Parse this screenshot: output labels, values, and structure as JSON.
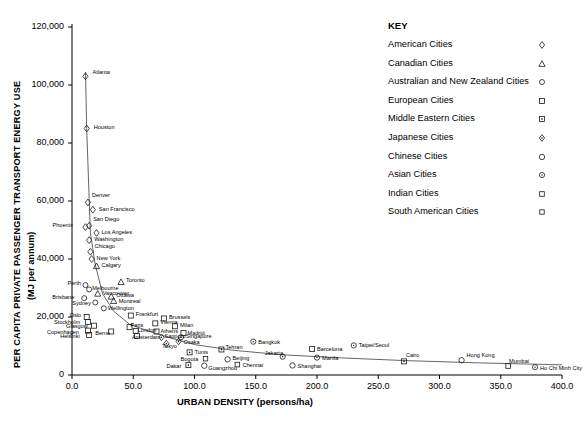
{
  "chart_data": {
    "type": "scatter",
    "title": "",
    "xlabel": "URBAN DENSITY (persons/ha)",
    "ylabel": "PER CAPITA PRIVATE PASSENGER TRANSPORT ENERGY USE",
    "ylabel_sub": "(MJ per annum)",
    "xlim": [
      0,
      400
    ],
    "ylim": [
      0,
      120000
    ],
    "xticks": [
      "0.0",
      "50.0",
      "100.0",
      "150.0",
      "200.0",
      "250.0",
      "300.0",
      "350.0",
      "400.0"
    ],
    "xtick_values": [
      0,
      50,
      100,
      150,
      200,
      250,
      300,
      350,
      400
    ],
    "yticks": [
      "0",
      "20,000",
      "40,000",
      "60,000",
      "80,000",
      "100,000",
      "120,000"
    ],
    "ytick_values": [
      0,
      20000,
      40000,
      60000,
      80000,
      100000,
      120000
    ],
    "grid": false,
    "legend_position": "right-top",
    "trend_line": true,
    "points": [
      {
        "label": "Atlanta",
        "x": 11,
        "y": 103000,
        "group": "american",
        "lx": 7,
        "ly": -7
      },
      {
        "label": "Houston",
        "x": 12,
        "y": 85000,
        "group": "american",
        "lx": 7,
        "ly": -5
      },
      {
        "label": "Denver",
        "x": 13,
        "y": 59500,
        "group": "american",
        "lx": 4,
        "ly": -10
      },
      {
        "label": "San Francisco",
        "x": 17,
        "y": 57000,
        "group": "american",
        "lx": 6,
        "ly": -4
      },
      {
        "label": "Phoenix",
        "x": 11,
        "y": 51000,
        "group": "american",
        "lx": -33,
        "ly": -5
      },
      {
        "label": "San Diego",
        "x": 14,
        "y": 51500,
        "group": "american",
        "lx": 4,
        "ly": -10
      },
      {
        "label": "Los Angeles",
        "x": 20,
        "y": 49000,
        "group": "american",
        "lx": 5,
        "ly": -4
      },
      {
        "label": "Washington",
        "x": 14,
        "y": 46500,
        "group": "american",
        "lx": 5,
        "ly": -4
      },
      {
        "label": "Chicago",
        "x": 15,
        "y": 42500,
        "group": "american",
        "lx": 4,
        "ly": -9
      },
      {
        "label": "New York",
        "x": 16,
        "y": 40000,
        "group": "american",
        "lx": 5,
        "ly": -4
      },
      {
        "label": "Calgary",
        "x": 20,
        "y": 37500,
        "group": "canadian",
        "lx": 5,
        "ly": -4
      },
      {
        "label": "Perth",
        "x": 11,
        "y": 31000,
        "group": "anzac",
        "lx": -18,
        "ly": -5
      },
      {
        "label": "Toronto",
        "x": 40,
        "y": 32000,
        "group": "canadian",
        "lx": 5,
        "ly": -5
      },
      {
        "label": "Melbourne",
        "x": 14,
        "y": 29500,
        "group": "anzac",
        "lx": 3,
        "ly": -4
      },
      {
        "label": "Vancouver",
        "x": 21,
        "y": 28000,
        "group": "canadian",
        "lx": 5,
        "ly": -4
      },
      {
        "label": "Brisbane",
        "x": 10,
        "y": 26500,
        "group": "anzac",
        "lx": -32,
        "ly": -4
      },
      {
        "label": "Ottawa",
        "x": 32,
        "y": 27000,
        "group": "canadian",
        "lx": 5,
        "ly": -5
      },
      {
        "label": "Sydney",
        "x": 19,
        "y": 25000,
        "group": "anzac",
        "lx": -23,
        "ly": -3
      },
      {
        "label": "Montreal",
        "x": 34,
        "y": 25500,
        "group": "canadian",
        "lx": 5,
        "ly": -3
      },
      {
        "label": "Wellington",
        "x": 26,
        "y": 23000,
        "group": "anzac",
        "lx": 4,
        "ly": -3
      },
      {
        "label": "Oslo",
        "x": 12,
        "y": 20000,
        "group": "european",
        "lx": -17,
        "ly": -5
      },
      {
        "label": "Frankfurt",
        "x": 48,
        "y": 20500,
        "group": "european",
        "lx": 5,
        "ly": -5
      },
      {
        "label": "Brussels",
        "x": 75,
        "y": 19500,
        "group": "european",
        "lx": 5,
        "ly": -4
      },
      {
        "label": "Stockholm",
        "x": 13,
        "y": 18300,
        "group": "european",
        "lx": -34,
        "ly": -3
      },
      {
        "label": "Vienna",
        "x": 68,
        "y": 17800,
        "group": "european",
        "lx": 5,
        "ly": -4
      },
      {
        "label": "Glasgow",
        "x": 18,
        "y": 17000,
        "group": "european",
        "lx": -28,
        "ly": -3
      },
      {
        "label": "Milan",
        "x": 84,
        "y": 16800,
        "group": "european",
        "lx": 5,
        "ly": -4
      },
      {
        "label": "Paris",
        "x": 47,
        "y": 16500,
        "group": "european",
        "lx": 1,
        "ly": -5
      },
      {
        "label": "Copenhagen",
        "x": 13,
        "y": 15300,
        "group": "european",
        "lx": -41,
        "ly": -2
      },
      {
        "label": "Berne",
        "x": 32,
        "y": 15000,
        "group": "european",
        "lx": -16,
        "ly": -2
      },
      {
        "label": "London",
        "x": 52,
        "y": 15200,
        "group": "european",
        "lx": 2,
        "ly": -4
      },
      {
        "label": "Athens",
        "x": 69,
        "y": 15000,
        "group": "european",
        "lx": 4,
        "ly": -4
      },
      {
        "label": "Madrid",
        "x": 91,
        "y": 14500,
        "group": "european",
        "lx": 4,
        "ly": -3
      },
      {
        "label": "Helsinki",
        "x": 14,
        "y": 13800,
        "group": "european",
        "lx": -29,
        "ly": -2
      },
      {
        "label": "Amsterdam",
        "x": 53,
        "y": 13500,
        "group": "european",
        "lx": -5,
        "ly": -2
      },
      {
        "label": "Sapporo",
        "x": 73,
        "y": 13000,
        "group": "japanese",
        "lx": 3,
        "ly": -4
      },
      {
        "label": "Singapore",
        "x": 89,
        "y": 13000,
        "group": "asian",
        "lx": 5,
        "ly": -4
      },
      {
        "label": "Osaka",
        "x": 87,
        "y": 11600,
        "group": "japanese",
        "lx": 5,
        "ly": -2
      },
      {
        "label": "Tokyo",
        "x": 77,
        "y": 10800,
        "group": "japanese",
        "lx": -4,
        "ly": -1
      },
      {
        "label": "Bangkok",
        "x": 148,
        "y": 11500,
        "group": "asian",
        "lx": 5,
        "ly": -3
      },
      {
        "label": "Tunis",
        "x": 96,
        "y": 7800,
        "group": "mideast",
        "lx": 5,
        "ly": -3
      },
      {
        "label": "Tehran",
        "x": 122,
        "y": 8800,
        "group": "mideast",
        "lx": 4,
        "ly": -5
      },
      {
        "label": "Barcelona",
        "x": 196,
        "y": 9000,
        "group": "european",
        "lx": 5,
        "ly": -3
      },
      {
        "label": "Taipei/Seoul",
        "x": 230,
        "y": 10200,
        "group": "asian",
        "lx": 5,
        "ly": -3
      },
      {
        "label": "Jakarta",
        "x": 172,
        "y": 6300,
        "group": "asian",
        "lx": -18,
        "ly": -7
      },
      {
        "label": "Manila",
        "x": 200,
        "y": 6000,
        "group": "asian",
        "lx": 5,
        "ly": -3
      },
      {
        "label": "Bogota",
        "x": 109,
        "y": 5600,
        "group": "southamerican",
        "lx": -25,
        "ly": -3
      },
      {
        "label": "Beijing",
        "x": 127,
        "y": 5400,
        "group": "chinese",
        "lx": 5,
        "ly": -4
      },
      {
        "label": "Dakar",
        "x": 95,
        "y": 3400,
        "group": "mideast",
        "lx": -22,
        "ly": -2
      },
      {
        "label": "Guangzhou",
        "x": 108,
        "y": 3200,
        "group": "chinese",
        "lx": 4,
        "ly": -1
      },
      {
        "label": "Chennai",
        "x": 135,
        "y": 3600,
        "group": "indian",
        "lx": 5,
        "ly": -3
      },
      {
        "label": "Shanghai",
        "x": 180,
        "y": 3300,
        "group": "chinese",
        "lx": 5,
        "ly": -2
      },
      {
        "label": "Cairo",
        "x": 271,
        "y": 4700,
        "group": "mideast",
        "lx": 2,
        "ly": -9
      },
      {
        "label": "Hong Kong",
        "x": 318,
        "y": 5100,
        "group": "chinese",
        "lx": 5,
        "ly": -8
      },
      {
        "label": "Mumbai",
        "x": 356,
        "y": 3100,
        "group": "indian",
        "lx": 1,
        "ly": -8
      },
      {
        "label": "Ho Chi Minh City",
        "x": 378,
        "y": 2700,
        "group": "asian",
        "lx": 5,
        "ly": -2
      }
    ],
    "curve": [
      {
        "x": 11,
        "y": 104500
      },
      {
        "x": 12,
        "y": 85000
      },
      {
        "x": 15,
        "y": 49000
      },
      {
        "x": 19,
        "y": 38000
      },
      {
        "x": 25,
        "y": 28000
      },
      {
        "x": 34,
        "y": 22000
      },
      {
        "x": 47,
        "y": 17500
      },
      {
        "x": 62,
        "y": 15200
      },
      {
        "x": 80,
        "y": 12800
      },
      {
        "x": 100,
        "y": 10500
      },
      {
        "x": 130,
        "y": 8600
      },
      {
        "x": 170,
        "y": 7000
      },
      {
        "x": 220,
        "y": 5900
      },
      {
        "x": 270,
        "y": 5000
      },
      {
        "x": 330,
        "y": 4200
      },
      {
        "x": 400,
        "y": 3500
      }
    ]
  },
  "key": {
    "title": "KEY",
    "items": [
      {
        "label": "American Cities",
        "marker": "diamond",
        "group": "american"
      },
      {
        "label": "Canadian Cities",
        "marker": "triangle",
        "group": "canadian"
      },
      {
        "label": "Australian and New Zealand Cities",
        "marker": "circle",
        "group": "anzac"
      },
      {
        "label": "European Cities",
        "marker": "square",
        "group": "european"
      },
      {
        "label": "Middle Eastern Cities",
        "marker": "square-dot",
        "group": "mideast"
      },
      {
        "label": "Japanese Cities",
        "marker": "diamond-dot",
        "group": "japanese"
      },
      {
        "label": "Chinese Cities",
        "marker": "circle-open",
        "group": "chinese"
      },
      {
        "label": "Asian Cities",
        "marker": "circle-dot",
        "group": "asian"
      },
      {
        "label": "Indian Cities",
        "marker": "square-small",
        "group": "indian"
      },
      {
        "label": "South American Cities",
        "marker": "square-tiny",
        "group": "southamerican"
      }
    ]
  },
  "colors": {
    "axis": "#000000",
    "marker": "#1a1a1a",
    "curve": "#555555",
    "text": "#000000",
    "background": "#ffffff"
  }
}
